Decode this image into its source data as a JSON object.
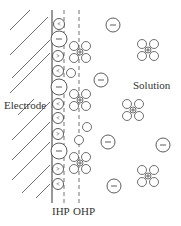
{
  "labels": {
    "electrode": "Electrode",
    "solution": "Solution",
    "ihp": "IHP",
    "ohp": "OHP"
  },
  "colors": {
    "stroke": "#333333",
    "background": "#ffffff"
  },
  "symbols": {
    "anion": "−",
    "cation": "+",
    "water_dipole": "<"
  }
}
